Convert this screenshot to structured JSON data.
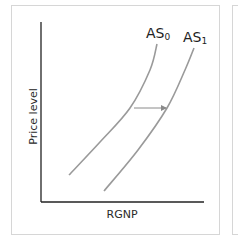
{
  "chart_data": {
    "type": "line",
    "title": "",
    "xlabel": "RGNP",
    "ylabel": "Price level",
    "grid": false,
    "legend": "none (direct curve labels)",
    "series": [
      {
        "name": "AS0",
        "label_base": "AS",
        "label_sub": "0",
        "points_px": [
          [
            69,
            175
          ],
          [
            100,
            142
          ],
          [
            130,
            108
          ],
          [
            150,
            70
          ],
          [
            157,
            44
          ]
        ],
        "color": "#9a9a9a"
      },
      {
        "name": "AS1",
        "label_base": "AS",
        "label_sub": "1",
        "points_px": [
          [
            104,
            191
          ],
          [
            138,
            150
          ],
          [
            167,
            108
          ],
          [
            185,
            70
          ],
          [
            194,
            48
          ]
        ],
        "color": "#9a9a9a"
      }
    ],
    "annotations": [
      {
        "type": "arrow",
        "direction": "right",
        "from_px": [
          134,
          108
        ],
        "to_px": [
          166,
          108
        ],
        "meaning": "rightward shift of aggregate supply from AS0 to AS1",
        "color": "#8a8a8a"
      }
    ],
    "axes": {
      "origin_px": [
        41,
        202
      ],
      "y_top_px": 22,
      "x_right_px": 204,
      "color": "#222222"
    }
  }
}
